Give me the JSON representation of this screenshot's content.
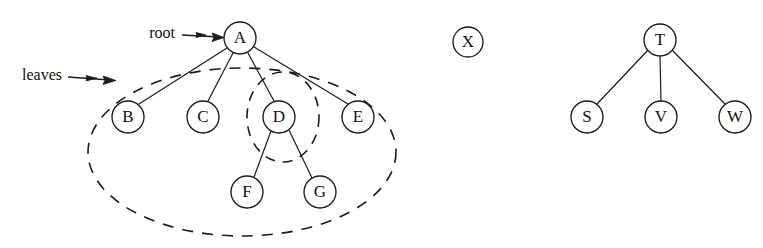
{
  "figure": {
    "background_color": "#ffffff",
    "stroke_color": "#1a1a1a",
    "width": 763,
    "height": 248
  },
  "annotations": [
    {
      "id": "root",
      "label": "root",
      "text_x": 175,
      "text_y": 33,
      "arrow_x1": 206,
      "arrow_y1": 35,
      "arrow_x2": 223,
      "arrow_y2": 37,
      "points_to": "node-a"
    },
    {
      "id": "leaves",
      "label": "leaves",
      "text_x": 10,
      "text_y": 75,
      "arrow_x1": 57,
      "arrow_y1": 77,
      "arrow_x2": 96,
      "arrow_y2": 80,
      "points_to": "leaves-ellipse"
    }
  ],
  "trees": [
    {
      "id": "tree-1",
      "nodes": [
        {
          "id": "node-a",
          "label": "A",
          "cx": 240,
          "cy": 38,
          "r": 16
        },
        {
          "id": "node-b",
          "label": "B",
          "cx": 128,
          "cy": 117,
          "r": 16
        },
        {
          "id": "node-c",
          "label": "C",
          "cx": 203,
          "cy": 117,
          "r": 16
        },
        {
          "id": "node-d",
          "label": "D",
          "cx": 279,
          "cy": 117,
          "r": 16
        },
        {
          "id": "node-e",
          "label": "E",
          "cx": 358,
          "cy": 117,
          "r": 16
        },
        {
          "id": "node-f",
          "label": "F",
          "cx": 247,
          "cy": 192,
          "r": 16
        },
        {
          "id": "node-g",
          "label": "G",
          "cx": 320,
          "cy": 192,
          "r": 16
        }
      ],
      "edges": [
        {
          "id": "edge-a-b",
          "from": "node-a",
          "to": "node-b"
        },
        {
          "id": "edge-a-c",
          "from": "node-a",
          "to": "node-c"
        },
        {
          "id": "edge-a-d",
          "from": "node-a",
          "to": "node-d"
        },
        {
          "id": "edge-a-e",
          "from": "node-a",
          "to": "node-e"
        },
        {
          "id": "edge-d-f",
          "from": "node-d",
          "to": "node-f"
        },
        {
          "id": "edge-d-g",
          "from": "node-d",
          "to": "node-g"
        }
      ]
    },
    {
      "id": "tree-2",
      "nodes": [
        {
          "id": "node-x",
          "label": "X",
          "cx": 468,
          "cy": 42,
          "r": 15
        }
      ],
      "edges": []
    },
    {
      "id": "tree-3",
      "nodes": [
        {
          "id": "node-t",
          "label": "T",
          "cx": 660,
          "cy": 40,
          "r": 16
        },
        {
          "id": "node-s",
          "label": "S",
          "cx": 587,
          "cy": 117,
          "r": 16
        },
        {
          "id": "node-v",
          "label": "V",
          "cx": 661,
          "cy": 117,
          "r": 16
        },
        {
          "id": "node-w",
          "label": "W",
          "cx": 735,
          "cy": 117,
          "r": 16
        }
      ],
      "edges": [
        {
          "id": "edge-t-s",
          "from": "node-t",
          "to": "node-s"
        },
        {
          "id": "edge-t-v",
          "from": "node-t",
          "to": "node-v"
        },
        {
          "id": "edge-t-w",
          "from": "node-t",
          "to": "node-w"
        }
      ]
    }
  ],
  "groupings": [
    {
      "id": "leaves-ellipse",
      "name": "leaves-grouping-ellipse",
      "cx": 242,
      "cy": 152,
      "rx": 154,
      "ry": 84,
      "rotation": 0,
      "style": "dashed"
    },
    {
      "id": "subtree-ellipse",
      "name": "subtree-d-grouping-ellipse",
      "cx": 283,
      "cy": 117,
      "rx": 36,
      "ry": 45,
      "rotation": 0,
      "style": "dashed"
    }
  ]
}
